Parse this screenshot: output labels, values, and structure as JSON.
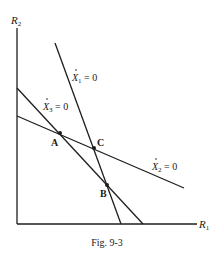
{
  "figure": {
    "caption": "Fig. 9-3",
    "axes": {
      "x_label": "R",
      "x_sub": "1",
      "y_label": "R",
      "y_sub": "2"
    },
    "lines": [
      {
        "id": "x1",
        "label_var": "X",
        "label_sub": "1",
        "label_eq": " = 0"
      },
      {
        "id": "x2",
        "label_var": "X",
        "label_sub": "2",
        "label_eq": " = 0"
      },
      {
        "id": "x3",
        "label_var": "X",
        "label_sub": "3",
        "label_eq": " = 0"
      }
    ],
    "points": [
      {
        "label": "A"
      },
      {
        "label": "B"
      },
      {
        "label": "C"
      }
    ],
    "colors": {
      "ink": "#1e1e1e",
      "background": "#ffffff"
    }
  }
}
